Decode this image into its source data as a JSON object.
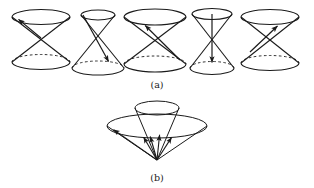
{
  "figure": {
    "background_color": "#ffffff",
    "stroke_color": "#1a1a1a",
    "captions": {
      "a": "(a)",
      "b": "(b)"
    }
  },
  "panel_a": {
    "label": "(a)",
    "label_x": 157,
    "label_y": 85,
    "description": "Row of five double cones, each containing a vector drawn from the common apex",
    "cones": [
      {
        "id": "cone-a-1",
        "index": 1,
        "apex_x": 41,
        "apex_y": 38,
        "top_ring_cy": 17,
        "top_ring_rx": 29,
        "top_ring_ry": 7.5,
        "bottom_ring_cy": 62,
        "bottom_ring_rx": 29,
        "bottom_ring_ry": 7.5,
        "arrow_tip_x": 16,
        "arrow_tip_y": 18.5,
        "arrow_label": "spacelike-left-up",
        "vector_type": "spacelike"
      },
      {
        "id": "cone-a-2",
        "index": 2,
        "apex_x": 98,
        "apex_y": 42,
        "top_ring_cy": 15,
        "top_ring_rx": 17,
        "top_ring_ry": 5,
        "bottom_ring_cy": 68,
        "bottom_ring_rx": 26,
        "bottom_ring_ry": 7,
        "arrow_tip_x": 110,
        "arrow_tip_y": 64,
        "arrow_label": "timelike-down-right",
        "vector_type": "timelike-past"
      },
      {
        "id": "cone-a-3",
        "index": 3,
        "apex_x": 155,
        "apex_y": 41,
        "top_ring_cy": 17,
        "top_ring_rx": 31,
        "top_ring_ry": 8,
        "bottom_ring_cy": 64,
        "bottom_ring_rx": 31,
        "bottom_ring_ry": 8,
        "arrow_tip_x": 144,
        "arrow_tip_y": 23,
        "arrow_label": "timelike-up-left",
        "vector_type": "timelike-future"
      },
      {
        "id": "cone-a-4",
        "index": 4,
        "apex_x": 212,
        "apex_y": 41,
        "top_ring_cy": 14,
        "top_ring_rx": 20,
        "top_ring_ry": 5.5,
        "bottom_ring_cy": 68,
        "bottom_ring_rx": 22,
        "bottom_ring_ry": 6.5,
        "arrow_tip_x": 212,
        "arrow_tip_y": 65,
        "arrow_label": "timelike-straight-down",
        "vector_type": "timelike-past"
      },
      {
        "id": "cone-a-5",
        "index": 5,
        "apex_x": 270,
        "apex_y": 41,
        "top_ring_cy": 17,
        "top_ring_rx": 29,
        "top_ring_ry": 7.5,
        "bottom_ring_cy": 63,
        "bottom_ring_rx": 29,
        "bottom_ring_ry": 7.5,
        "arrow_tip_x": 279,
        "arrow_tip_y": 24,
        "arrow_label": "lightlike-up-right",
        "vector_type": "lightlike"
      }
    ]
  },
  "panel_b": {
    "label": "(b)",
    "label_x": 157,
    "label_y": 178,
    "description": "Single outer cone with an inner nested cone and five vectors fanning out from the lower apex",
    "apex_x": 157,
    "apex_y": 160,
    "outer_ring_cx": 157,
    "outer_ring_cy": 126,
    "outer_ring_rx": 50,
    "outer_ring_ry": 12,
    "inner_ring_cx": 157,
    "inner_ring_cy": 108,
    "inner_ring_rx": 22,
    "inner_ring_ry": 7,
    "arrows": [
      {
        "id": "arrow-b-1",
        "tip_x": 110,
        "tip_y": 130,
        "label": "outer-left"
      },
      {
        "id": "arrow-b-2",
        "tip_x": 141,
        "tip_y": 133,
        "label": "inner-left"
      },
      {
        "id": "arrow-b-3",
        "tip_x": 149,
        "tip_y": 131,
        "label": "inner-mid-left"
      },
      {
        "id": "arrow-b-4",
        "tip_x": 160,
        "tip_y": 130,
        "label": "inner-center"
      },
      {
        "id": "arrow-b-5",
        "tip_x": 174,
        "tip_y": 133,
        "label": "inner-right"
      }
    ]
  }
}
